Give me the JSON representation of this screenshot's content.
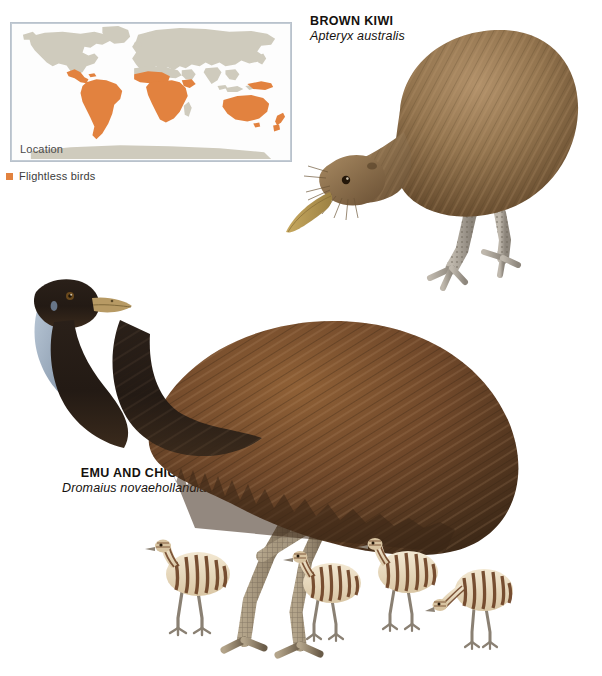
{
  "page": {
    "background_color": "#ffffff",
    "width": 602,
    "height": 676,
    "type": "natural-history-illustration-plate"
  },
  "map": {
    "title": "Location",
    "frame_color": "#b9c2cc",
    "land_color": "#cfcbbd",
    "highlight_color": "#e2823f",
    "ocean_color": "#fdfdfd",
    "projection": "world-equirectangular",
    "highlighted_regions": [
      "Central America",
      "South America",
      "Sub-Saharan Africa",
      "Australia",
      "New Guinea",
      "New Zealand"
    ],
    "legend": {
      "swatch_color": "#e2823f",
      "label": "Flightless birds"
    }
  },
  "specimens": [
    {
      "id": "brown-kiwi",
      "common_name": "BROWN KIWI",
      "scientific_name": "Apteryx australis",
      "plumage_color": "#8a6a44",
      "bill_color": "#c9a559",
      "leg_color": "#b0aa9e"
    },
    {
      "id": "emu-and-chicks",
      "common_name": "EMU AND CHICKS",
      "scientific_name": "Dromaius novaehollandiae",
      "plumage_color": "#6f4a2a",
      "head_color": "#2a2019",
      "neck_patch_color": "#9fb0c4",
      "bill_color": "#b79a64",
      "leg_color": "#9b8a72",
      "chick_count": 4,
      "chick_stripe_colors": [
        "#f0e3cc",
        "#6b3f22"
      ]
    }
  ]
}
